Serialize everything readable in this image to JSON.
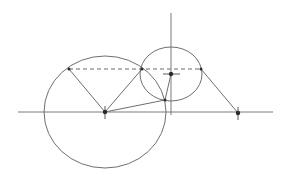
{
  "diagram": {
    "type": "geometric-construction",
    "axes": {
      "horizontal": {
        "x1": 18,
        "y1": 112,
        "x2": 273,
        "y2": 112
      },
      "vertical": {
        "x1": 171,
        "y1": 13,
        "x2": 171,
        "y2": 115
      }
    },
    "circles": [
      {
        "name": "large-circle",
        "cx": 105,
        "cy": 112,
        "rx": 61,
        "ry": 56
      },
      {
        "name": "small-circle",
        "cx": 171,
        "cy": 74,
        "rx": 31,
        "ry": 27
      }
    ],
    "dashed_line": {
      "x1": 69,
      "y1": 69,
      "x2": 201,
      "y2": 69
    },
    "segments": [
      {
        "name": "left-chord",
        "x1": 69,
        "y1": 69,
        "x2": 105,
        "y2": 112
      },
      {
        "name": "middle-chord",
        "x1": 142,
        "y1": 69,
        "x2": 105,
        "y2": 112
      },
      {
        "name": "center-to-lower-point",
        "x1": 105,
        "y1": 112,
        "x2": 165,
        "y2": 100
      },
      {
        "name": "lower-point-to-small-center",
        "x1": 165,
        "y1": 100,
        "x2": 171,
        "y2": 74
      },
      {
        "name": "right-slant",
        "x1": 201,
        "y1": 69,
        "x2": 238,
        "y2": 113
      }
    ],
    "points": [
      {
        "name": "large-center",
        "x": 105,
        "y": 112
      },
      {
        "name": "small-center",
        "x": 171,
        "y": 74
      },
      {
        "name": "right-point",
        "x": 238,
        "y": 113
      },
      {
        "name": "intersection-top",
        "x": 142,
        "y": 69
      },
      {
        "name": "left-top-point",
        "x": 69,
        "y": 69
      },
      {
        "name": "right-top-point",
        "x": 201,
        "y": 69
      },
      {
        "name": "lower-point",
        "x": 165,
        "y": 100
      }
    ],
    "colors": {
      "stroke": "#6f6f6f",
      "point": "#2b2b2b",
      "background": "#ffffff"
    }
  }
}
